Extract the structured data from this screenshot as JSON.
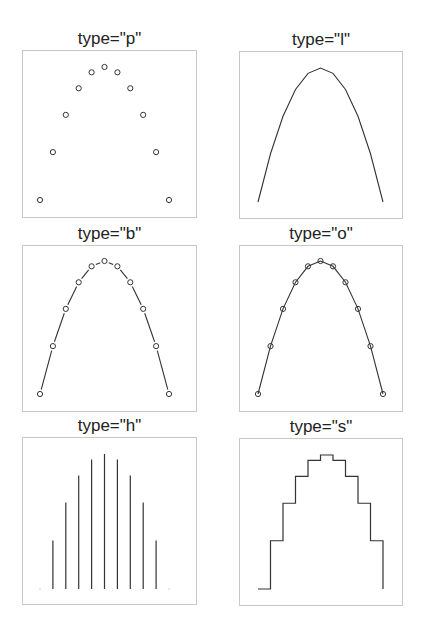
{
  "chart_data": [
    {
      "type": "scatter",
      "plot_type_code": "p",
      "title": "type=\"p\"",
      "x": [
        -5,
        -4,
        -3,
        -2,
        -1,
        0,
        1,
        2,
        3,
        4,
        5
      ],
      "y": [
        -25,
        -16,
        -9,
        -4,
        -1,
        0,
        -1,
        -4,
        -9,
        -16,
        -25
      ],
      "marker": "open-circle",
      "xlabel": "",
      "ylabel": "",
      "axes": false,
      "grid": false,
      "box": true
    },
    {
      "type": "line",
      "plot_type_code": "l",
      "title": "type=\"l\"",
      "x": [
        -5,
        -4,
        -3,
        -2,
        -1,
        0,
        1,
        2,
        3,
        4,
        5
      ],
      "y": [
        -25,
        -16,
        -9,
        -4,
        -1,
        0,
        -1,
        -4,
        -9,
        -16,
        -25
      ],
      "marker": "none",
      "xlabel": "",
      "ylabel": "",
      "axes": false,
      "grid": false,
      "box": true
    },
    {
      "type": "line",
      "plot_type_code": "b",
      "title": "type=\"b\"",
      "x": [
        -5,
        -4,
        -3,
        -2,
        -1,
        0,
        1,
        2,
        3,
        4,
        5
      ],
      "y": [
        -25,
        -16,
        -9,
        -4,
        -1,
        0,
        -1,
        -4,
        -9,
        -16,
        -25
      ],
      "marker": "open-circle",
      "line_style": "both (broken line between points)",
      "xlabel": "",
      "ylabel": "",
      "axes": false,
      "grid": false,
      "box": true
    },
    {
      "type": "line",
      "plot_type_code": "o",
      "title": "type=\"o\"",
      "x": [
        -5,
        -4,
        -3,
        -2,
        -1,
        0,
        1,
        2,
        3,
        4,
        5
      ],
      "y": [
        -25,
        -16,
        -9,
        -4,
        -1,
        0,
        -1,
        -4,
        -9,
        -16,
        -25
      ],
      "marker": "open-circle",
      "line_style": "overplotted (line through points)",
      "xlabel": "",
      "ylabel": "",
      "axes": false,
      "grid": false,
      "box": true
    },
    {
      "type": "bar",
      "plot_type_code": "h",
      "title": "type=\"h\"",
      "x": [
        -5,
        -4,
        -3,
        -2,
        -1,
        0,
        1,
        2,
        3,
        4,
        5
      ],
      "y": [
        -25,
        -16,
        -9,
        -4,
        -1,
        0,
        -1,
        -4,
        -9,
        -16,
        -25
      ],
      "line_style": "histogram-like vertical lines from bottom",
      "xlabel": "",
      "ylabel": "",
      "axes": false,
      "grid": false,
      "box": true
    },
    {
      "type": "line",
      "plot_type_code": "s",
      "title": "type=\"s\"",
      "x": [
        -5,
        -4,
        -3,
        -2,
        -1,
        0,
        1,
        2,
        3,
        4,
        5
      ],
      "y": [
        -25,
        -16,
        -9,
        -4,
        -1,
        0,
        -1,
        -4,
        -9,
        -16,
        -25
      ],
      "line_style": "stair steps",
      "xlabel": "",
      "ylabel": "",
      "axes": false,
      "grid": false,
      "box": true
    }
  ],
  "layout": {
    "rows": 3,
    "cols": 2,
    "panels": [
      {
        "left": 22,
        "top": 50,
        "width": 175,
        "height": 168,
        "inset": {
          "l": 18,
          "r": 28,
          "t": 17,
          "b": 18
        }
      },
      {
        "left": 239,
        "top": 51,
        "width": 164,
        "height": 168,
        "inset": {
          "l": 19,
          "r": 20,
          "t": 17,
          "b": 17
        }
      },
      {
        "left": 22,
        "top": 245,
        "width": 175,
        "height": 167,
        "inset": {
          "l": 18,
          "r": 28,
          "t": 16,
          "b": 18
        }
      },
      {
        "left": 239,
        "top": 245,
        "width": 164,
        "height": 167,
        "inset": {
          "l": 19,
          "r": 20,
          "t": 16,
          "b": 18
        }
      },
      {
        "left": 22,
        "top": 437,
        "width": 175,
        "height": 168,
        "inset": {
          "l": 18,
          "r": 28,
          "t": 17,
          "b": 16
        }
      },
      {
        "left": 239,
        "top": 438,
        "width": 164,
        "height": 168,
        "inset": {
          "l": 19,
          "r": 20,
          "t": 17,
          "b": 17
        }
      }
    ]
  },
  "colors": {
    "ink": "#333333",
    "box": "#c8c8c8",
    "background": "#ffffff"
  }
}
